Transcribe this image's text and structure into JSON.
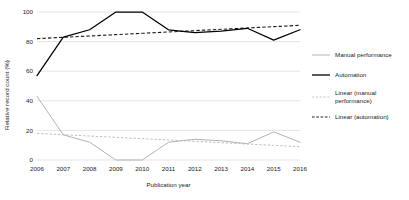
{
  "chart_data": {
    "type": "line",
    "title": "",
    "xlabel": "Publication year",
    "ylabel": "Relative record count (%)",
    "x": [
      2006,
      2007,
      2008,
      2009,
      2010,
      2011,
      2012,
      2013,
      2014,
      2015,
      2016
    ],
    "xtick_labels": [
      "2006",
      "2007",
      "2008",
      "2009",
      "2010",
      "2011",
      "2012",
      "2013",
      "2014",
      "2015",
      "2016"
    ],
    "ytick_labels": [
      "0",
      "20",
      "40",
      "60",
      "80",
      "100"
    ],
    "yticks": [
      0,
      20,
      40,
      60,
      80,
      100
    ],
    "ylim": [
      0,
      100
    ],
    "grid": "horizontal",
    "legend_position": "right",
    "series": [
      {
        "name": "Manual performance",
        "style": "solid",
        "color": "#b3b3b3",
        "values": [
          43,
          17,
          12,
          0,
          0,
          12,
          14,
          13,
          11,
          19,
          12
        ]
      },
      {
        "name": "Automation",
        "style": "solid",
        "color": "#000000",
        "values": [
          57,
          83,
          88,
          100,
          100,
          88,
          86,
          87,
          89,
          81,
          88
        ]
      },
      {
        "name": "Linear (manual performance)",
        "style": "dashed",
        "color": "#bfbfbf",
        "values": [
          18.0,
          17.1,
          16.2,
          15.3,
          14.4,
          13.5,
          12.6,
          11.7,
          10.8,
          9.9,
          9.0
        ]
      },
      {
        "name": "Linear (automation)",
        "style": "dashed",
        "color": "#1a1a1a",
        "values": [
          82.0,
          82.9,
          83.8,
          84.7,
          85.6,
          86.5,
          87.4,
          88.3,
          89.2,
          90.1,
          91.0
        ]
      }
    ]
  },
  "legend": {
    "entries": [
      {
        "label": "Manual performance"
      },
      {
        "label": "Automation"
      },
      {
        "label": "Linear (manual"
      },
      {
        "label": "performance)"
      },
      {
        "label": "Linear (automation)"
      }
    ]
  }
}
